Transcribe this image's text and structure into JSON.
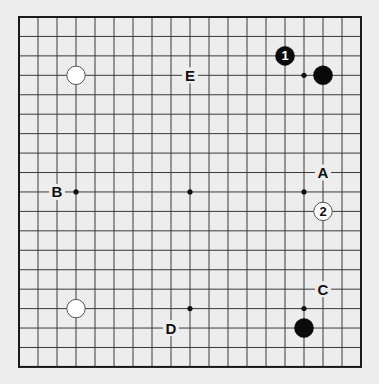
{
  "board": {
    "size": 19,
    "origin_x": 19,
    "origin_y": 17,
    "step_x": 19,
    "step_y": 19.44,
    "background": "#ededed",
    "line_color": "#3a3a3a",
    "border_color": "#1a1a1a"
  },
  "star_points": [
    [
      3,
      3
    ],
    [
      9,
      3
    ],
    [
      15,
      3
    ],
    [
      3,
      9
    ],
    [
      9,
      9
    ],
    [
      15,
      9
    ],
    [
      3,
      15
    ],
    [
      9,
      15
    ],
    [
      15,
      15
    ]
  ],
  "stones": [
    {
      "color": "white",
      "col": 3,
      "row": 3,
      "label": ""
    },
    {
      "color": "black",
      "col": 16,
      "row": 3,
      "label": ""
    },
    {
      "color": "white",
      "col": 3,
      "row": 15,
      "label": ""
    },
    {
      "color": "black",
      "col": 15,
      "row": 16,
      "label": ""
    },
    {
      "color": "black",
      "col": 14,
      "row": 2,
      "label": "1"
    },
    {
      "color": "white",
      "col": 16,
      "row": 10,
      "label": "2"
    }
  ],
  "labels": [
    {
      "text": "A",
      "col": 16,
      "row": 8
    },
    {
      "text": "B",
      "col": 2,
      "row": 9
    },
    {
      "text": "C",
      "col": 16,
      "row": 14
    },
    {
      "text": "D",
      "col": 8,
      "row": 16
    },
    {
      "text": "E",
      "col": 9,
      "row": 3
    }
  ]
}
